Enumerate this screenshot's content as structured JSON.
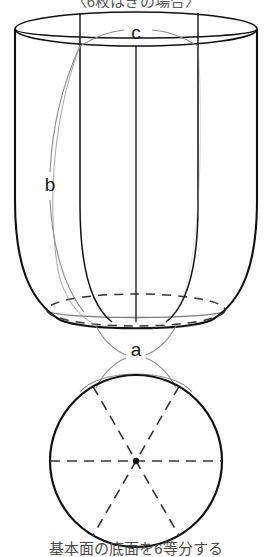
{
  "figure": {
    "title_top": "〈6枚はぎの場合〉",
    "caption_bottom": "基本面の底面を6等分する",
    "labels": {
      "top_rim_arc": "c",
      "side_seam": "b",
      "bottom_arc": "a"
    },
    "colors": {
      "ink": "#111111",
      "light_ink": "#7a7a7a",
      "dashed": "#444444",
      "caption": "#5a5a5a",
      "background": "#ffffff"
    },
    "geometry": {
      "segments": 6,
      "vessel": {
        "top_ellipse_cx": 136,
        "top_ellipse_cy": 29,
        "top_ellipse_rx": 121,
        "top_ellipse_ry": 17,
        "base_ellipse_cx": 136,
        "base_ellipse_cy": 310,
        "base_ellipse_rx": 89,
        "base_ellipse_ry": 16
      },
      "plan_circle": {
        "cx": 136,
        "cy": 461,
        "r": 86,
        "divisions": 6,
        "center_dot": true
      }
    }
  }
}
